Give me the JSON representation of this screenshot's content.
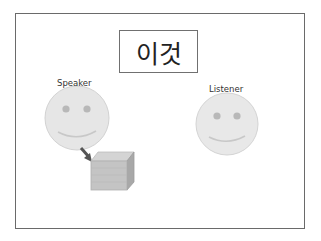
{
  "title": "이것",
  "figures": [
    {
      "role": "speaker",
      "label": "Speaker"
    },
    {
      "role": "listener",
      "label": "Listener"
    }
  ],
  "object": {
    "name": "box",
    "description": "gray cube near speaker"
  },
  "colors": {
    "face_fill": "#e6e6e6",
    "face_stroke": "#cfcfcf",
    "eye": "#b3b3b3",
    "smile": "#c4c4c4",
    "arrow": "#555555",
    "box_front": "#c4c4c4",
    "box_top": "#d6d6d6",
    "box_side": "#a9a9a9",
    "frame": "#6a6a6a"
  }
}
